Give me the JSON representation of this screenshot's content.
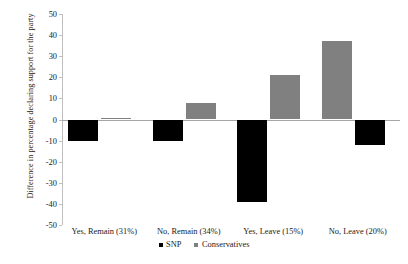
{
  "chart_data": {
    "type": "bar",
    "title": "",
    "xlabel": "",
    "ylabel": "Difference in percentage declaring support for the party",
    "categories": [
      "Yes, Remain (31%)",
      "No, Remain (34%)",
      "Yes, Leave (15%)",
      "No, Leave (20%)"
    ],
    "series": [
      {
        "name": "SNP",
        "color": "#000000",
        "values": [
          -10,
          -10,
          -39,
          -12
        ]
      },
      {
        "name": "Conservatives",
        "color": "#808080",
        "values": [
          0.6,
          8,
          21,
          37
        ]
      }
    ],
    "ylim": [
      -50,
      50
    ],
    "yticks": [
      50,
      40,
      30,
      20,
      10,
      0,
      -10,
      -20,
      -30,
      -40,
      -50
    ],
    "ytick_labels": [
      "50",
      "40",
      "30",
      "20",
      "10",
      "0",
      "-10",
      "-20",
      "-30",
      "-40",
      "-50"
    ],
    "grid": false,
    "legend_position": "bottom",
    "legend": [
      "SNP",
      "Conservatives"
    ],
    "zero_line": 0
  }
}
